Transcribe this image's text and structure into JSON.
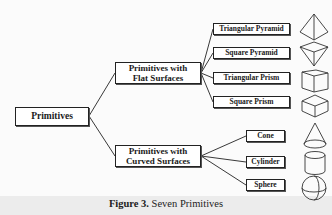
{
  "diagram": {
    "root": {
      "label": "Primitives"
    },
    "groups": [
      {
        "label_line1": "Primitives with",
        "label_line2": "Flat Surfaces",
        "children": [
          {
            "label": "Triangular Pyramid",
            "icon": "triangular-pyramid-icon"
          },
          {
            "label": "Square Pyramid",
            "icon": "square-pyramid-icon"
          },
          {
            "label": "Triangular Prism",
            "icon": "triangular-prism-icon"
          },
          {
            "label": "Square Prism",
            "icon": "square-prism-icon"
          }
        ]
      },
      {
        "label_line1": "Primitives with",
        "label_line2": "Curved Surfaces",
        "children": [
          {
            "label": "Cone",
            "icon": "cone-icon"
          },
          {
            "label": "Cylinder",
            "icon": "cylinder-icon"
          },
          {
            "label": "Sphere",
            "icon": "sphere-icon"
          }
        ]
      }
    ]
  },
  "caption": {
    "figure_label": "Figure 3.",
    "text": " Seven Primitives"
  },
  "colors": {
    "line": "#222222",
    "box_border": "#222222",
    "caption_band": "#ececec"
  }
}
